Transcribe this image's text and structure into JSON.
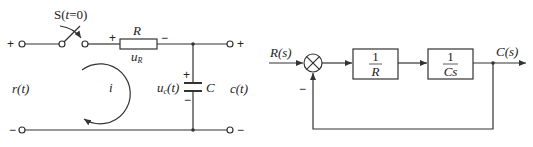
{
  "circuit": {
    "switch_label": "S(t=0)",
    "resistor_label": "R",
    "resistor_voltage_label": "u_R",
    "resistor_voltage_main": "u",
    "resistor_voltage_sub": "R",
    "capacitor_label": "C",
    "capacitor_voltage_main": "u",
    "capacitor_voltage_sub": "c",
    "capacitor_voltage_arg": "(t)",
    "input_label": "r(t)",
    "output_label": "c(t)",
    "current_label": "i",
    "plus": "+",
    "minus": "−"
  },
  "block_diagram": {
    "input_label": "R(s)",
    "output_label": "C(s)",
    "feedback_sign": "−",
    "blocks": [
      {
        "numerator": "1",
        "denominator": "R"
      },
      {
        "numerator": "1",
        "denominator": "Cs"
      }
    ]
  },
  "colors": {
    "line": "#333333",
    "text": "#222222",
    "background": "#ffffff"
  }
}
